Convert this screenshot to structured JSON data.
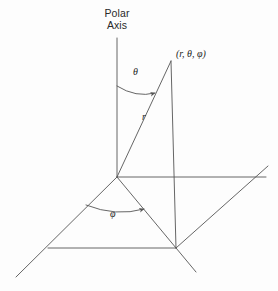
{
  "figure": {
    "title_label": "Polar Axis",
    "title_line_1": "Polar",
    "title_line_2": "Axis",
    "point_label": "(r, θ, φ)",
    "theta_label": "θ",
    "r_label": "r",
    "phi_label": "φ",
    "colors": {
      "background": "#fdfdfd",
      "line": "#555555",
      "text": "#1d1d1d"
    },
    "geometry": {
      "origin": [
        117,
        177
      ],
      "polar_axis_top": [
        117,
        38
      ],
      "point_top": [
        171,
        61
      ],
      "point_foot": [
        176,
        248
      ],
      "horizontal_axis_right": [
        266,
        177
      ],
      "plane_left_corner": [
        48,
        248
      ],
      "plane_far_left": [
        16,
        277
      ],
      "plane_right_corner": [
        237,
        177
      ],
      "plane_far_right": [
        268,
        166
      ],
      "theta_arc": {
        "start": [
          117,
          85
        ],
        "end": [
          156,
          94
        ]
      },
      "phi_arc": {
        "start": [
          86,
          205
        ],
        "end": [
          146,
          210
        ]
      }
    }
  }
}
